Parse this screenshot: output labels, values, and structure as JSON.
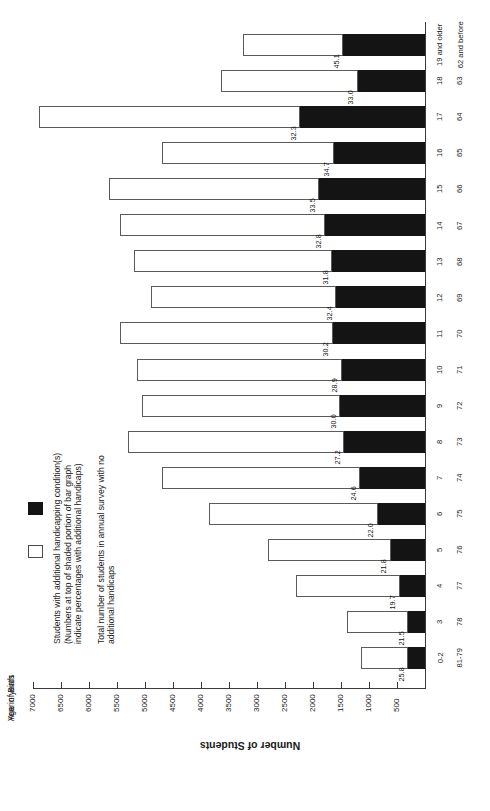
{
  "chart_data": {
    "type": "bar",
    "orientation": "horizontal-rotated",
    "title": "",
    "xlabel": "Age in years / Year of Birth",
    "ylabel": "Number of Students",
    "ylim": [
      0,
      7000
    ],
    "tick_values": [
      7000,
      6500,
      6000,
      5500,
      5000,
      4500,
      4000,
      3500,
      3000,
      2500,
      2000,
      1500,
      1000,
      500
    ],
    "grid": false,
    "legend_position": "bottom-left",
    "categories_age": [
      "0-2",
      "3",
      "4",
      "5",
      "6",
      "7",
      "8",
      "9",
      "10",
      "11",
      "12",
      "13",
      "14",
      "15",
      "16",
      "17",
      "18",
      "19 and older"
    ],
    "categories_yob": [
      "81-79",
      "78",
      "77",
      "76",
      "75",
      "74",
      "73",
      "72",
      "71",
      "70",
      "69",
      "68",
      "67",
      "66",
      "65",
      "64",
      "63",
      "62 and before"
    ],
    "series": [
      {
        "name": "Students with additional handicapping condition(s)",
        "values": [
          297,
          301,
          453,
          610,
          847,
          1156,
          1442,
          1515,
          1488,
          1646,
          1588,
          1654,
          1787,
          1893,
          1630,
          2229,
          1205,
          1466
        ]
      },
      {
        "name": "Total number of students in annual survey with no additional handicaps",
        "values": [
          853,
          1099,
          1847,
          2190,
          3003,
          3544,
          3858,
          3535,
          3662,
          3804,
          3312,
          3546,
          3663,
          3757,
          3067,
          4671,
          2445,
          1784
        ]
      }
    ],
    "totals": [
      1150,
      1400,
      2300,
      2800,
      3850,
      4700,
      5300,
      5050,
      5150,
      5450,
      4900,
      5200,
      5450,
      5650,
      4697,
      6900,
      3650,
      3250
    ],
    "percent_labels": [
      "25.8",
      "21.5",
      "19.7",
      "21.8",
      "22.0",
      "24.6",
      "27.2",
      "30.0",
      "28.9",
      "30.2",
      "32.4",
      "31.8",
      "32.8",
      "33.5",
      "34.7",
      "32.3",
      "33.0",
      "45.1"
    ]
  },
  "axis": {
    "value_axis_title": "Number of Students",
    "cat_axis_title_age": "Age in years",
    "cat_axis_title_yob": "Year of Birth"
  },
  "legend": {
    "items": [
      {
        "swatch": "black",
        "lines": [
          "Students with additional handicapping condition(s)",
          "(Numbers at top of shaded portion of bar graph",
          "indicate percentages with additional handicaps)"
        ]
      },
      {
        "swatch": "white",
        "lines": [
          "Total number of students in annual survey with no",
          "additional handicaps"
        ]
      }
    ]
  }
}
